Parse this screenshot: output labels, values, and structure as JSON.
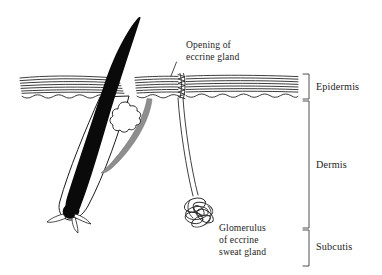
{
  "figure": {
    "title": "Cross-section of human skin showing hair follicle and eccrine sweat gland",
    "background_color": "#ffffff",
    "ink_color": "#1a1a1a",
    "muscle_color": "#8e8e8e"
  },
  "annotations": {
    "opening": {
      "line1": "Opening of",
      "line2": "eccrine gland"
    },
    "glomerulus": {
      "line1": "Glomerulus",
      "line2": "of eccrine",
      "line3": "sweat gland"
    }
  },
  "layers": [
    {
      "id": "epidermis",
      "label": "Epidermis"
    },
    {
      "id": "dermis",
      "label": "Dermis"
    },
    {
      "id": "subcutis",
      "label": "Subcutis"
    }
  ],
  "structures": [
    {
      "id": "hair-shaft",
      "name": "hair shaft"
    },
    {
      "id": "hair-follicle",
      "name": "hair follicle"
    },
    {
      "id": "sebaceous-gland",
      "name": "sebaceous gland"
    },
    {
      "id": "arrector-pili",
      "name": "arrector pili muscle"
    },
    {
      "id": "hair-bulb",
      "name": "hair bulb"
    },
    {
      "id": "dermal-papilla",
      "name": "dermal papilla"
    },
    {
      "id": "eccrine-duct",
      "name": "eccrine sweat duct"
    },
    {
      "id": "acrosyringium",
      "name": "acrosyringium spiral"
    },
    {
      "id": "glomerulus-coil",
      "name": "glomerulus coil"
    }
  ]
}
